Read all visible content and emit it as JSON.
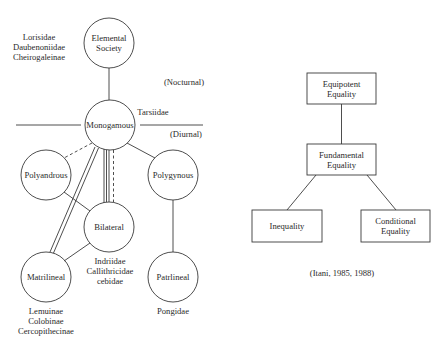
{
  "left_diagram": {
    "nodes": {
      "elemental": {
        "line1": "Elemental",
        "line2": "Society"
      },
      "monogamous": {
        "label": "Monogamous"
      },
      "polyandrous": {
        "label": "Polyandrous"
      },
      "polygynous": {
        "label": "Polygynous"
      },
      "bilateral": {
        "label": "Bilateral"
      },
      "matrilineal": {
        "label": "Matrilineal"
      },
      "patrilineal": {
        "label": "Patrlineal"
      }
    },
    "annotations": {
      "elemental_taxa": [
        "Lorisidae",
        "Daubenoniidae",
        "Cheirogaleinae"
      ],
      "nocturnal": "(Nocturnal)",
      "diurnal": "(Diurnal)",
      "tarsiidae": "Tarsiidae",
      "bilateral_taxa": [
        "Indriidae",
        "Callithricidae",
        "cebidae"
      ],
      "matrilineal_taxa": [
        "Lemuinae",
        "Colobinae",
        "Cercopithecinae"
      ],
      "patrilineal_taxa": [
        "Pongidae"
      ]
    }
  },
  "right_diagram": {
    "boxes": {
      "equipotent": {
        "line1": "Equipotent",
        "line2": "Equality"
      },
      "fundamental": {
        "line1": "Fundamental",
        "line2": "Equality"
      },
      "inequality": {
        "label": "Inequality"
      },
      "conditional": {
        "line1": "Conditional",
        "line2": "Equality"
      }
    },
    "citation": "(Itani, 1985, 1988)"
  },
  "colors": {
    "stroke": "#3a3a3a",
    "text": "#2a2a2a",
    "background": "#ffffff"
  }
}
